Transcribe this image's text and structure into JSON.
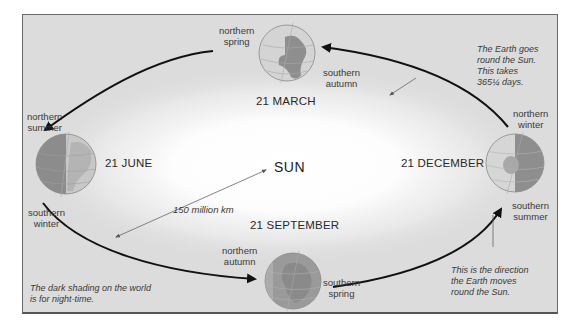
{
  "diagram": {
    "type": "earth-orbit-seasons",
    "center_label": "SUN",
    "distance_label": "150 million km",
    "colors": {
      "background": "#dcdcdc",
      "sun_glow": "#ffffff",
      "orbit_line": "#111111",
      "leader_line": "#555555",
      "globe_day": "#cfcfcf",
      "globe_night": "#8a8a8a",
      "text": "#3a3a3a"
    },
    "positions": [
      {
        "date": "21 MARCH",
        "north_label": "northern\nspring",
        "south_label": "southern\nautumn",
        "north_line1": "northern",
        "north_line2": "spring",
        "south_line1": "southern",
        "south_line2": "autumn"
      },
      {
        "date": "21 JUNE",
        "north_line1": "northern",
        "north_line2": "summer",
        "south_line1": "southern",
        "south_line2": "winter"
      },
      {
        "date": "21 SEPTEMBER",
        "north_line1": "northern",
        "north_line2": "autumn",
        "south_line1": "southern",
        "south_line2": "spring"
      },
      {
        "date": "21 DECEMBER",
        "north_line1": "northern",
        "north_line2": "winter",
        "south_line1": "southern",
        "south_line2": "summer"
      }
    ],
    "notes": {
      "orbit": [
        "The Earth goes",
        "round the Sun.",
        "This takes",
        "365¼ days."
      ],
      "direction": [
        "This is the direction",
        "the Earth moves",
        "round the Sun."
      ],
      "shading": [
        "The dark shading on the world",
        "is for night-time."
      ]
    }
  }
}
